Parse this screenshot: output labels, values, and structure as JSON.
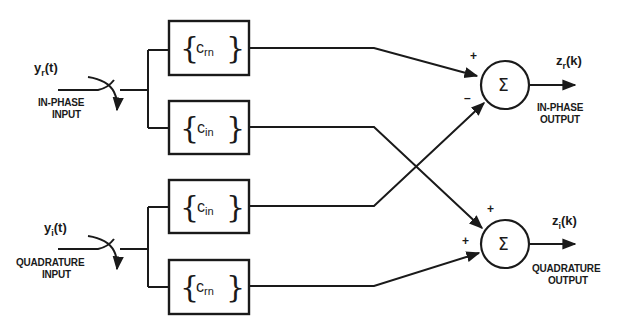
{
  "diagram": {
    "type": "block-diagram",
    "inputs": [
      {
        "id": "in_phase",
        "signal": "y",
        "subscript": "r",
        "arg": "(t)",
        "label_line1": "IN-PHASE",
        "label_line2": "INPUT"
      },
      {
        "id": "quadrature",
        "signal": "y",
        "subscript": "i",
        "arg": "(t)",
        "label_line1": "QUADRATURE",
        "label_line2": "INPUT"
      }
    ],
    "filters": [
      {
        "id": "f1",
        "symbol": "c",
        "subscript": "rn",
        "input": "in_phase",
        "to": "sum1",
        "sign": "+"
      },
      {
        "id": "f2",
        "symbol": "c",
        "subscript": "in",
        "input": "in_phase",
        "to": "sum2",
        "sign": "+"
      },
      {
        "id": "f3",
        "symbol": "c",
        "subscript": "in",
        "input": "quadrature",
        "to": "sum1",
        "sign": "−"
      },
      {
        "id": "f4",
        "symbol": "c",
        "subscript": "rn",
        "input": "quadrature",
        "to": "sum2",
        "sign": "+"
      }
    ],
    "summers": [
      {
        "id": "sum1",
        "symbol": "Σ",
        "sign_top": "+",
        "sign_bottom": "–"
      },
      {
        "id": "sum2",
        "symbol": "Σ",
        "sign_top": "+",
        "sign_bottom": "+"
      }
    ],
    "outputs": [
      {
        "id": "out_phase",
        "signal": "z",
        "subscript": "r",
        "arg": "(k)",
        "label_line1": "IN-PHASE",
        "label_line2": "OUTPUT"
      },
      {
        "id": "out_quad",
        "signal": "z",
        "subscript": "i",
        "arg": "(k)",
        "label_line1": "QUADRATURE",
        "label_line2": "OUTPUT"
      }
    ],
    "brace_open": "{",
    "brace_close": "}"
  }
}
